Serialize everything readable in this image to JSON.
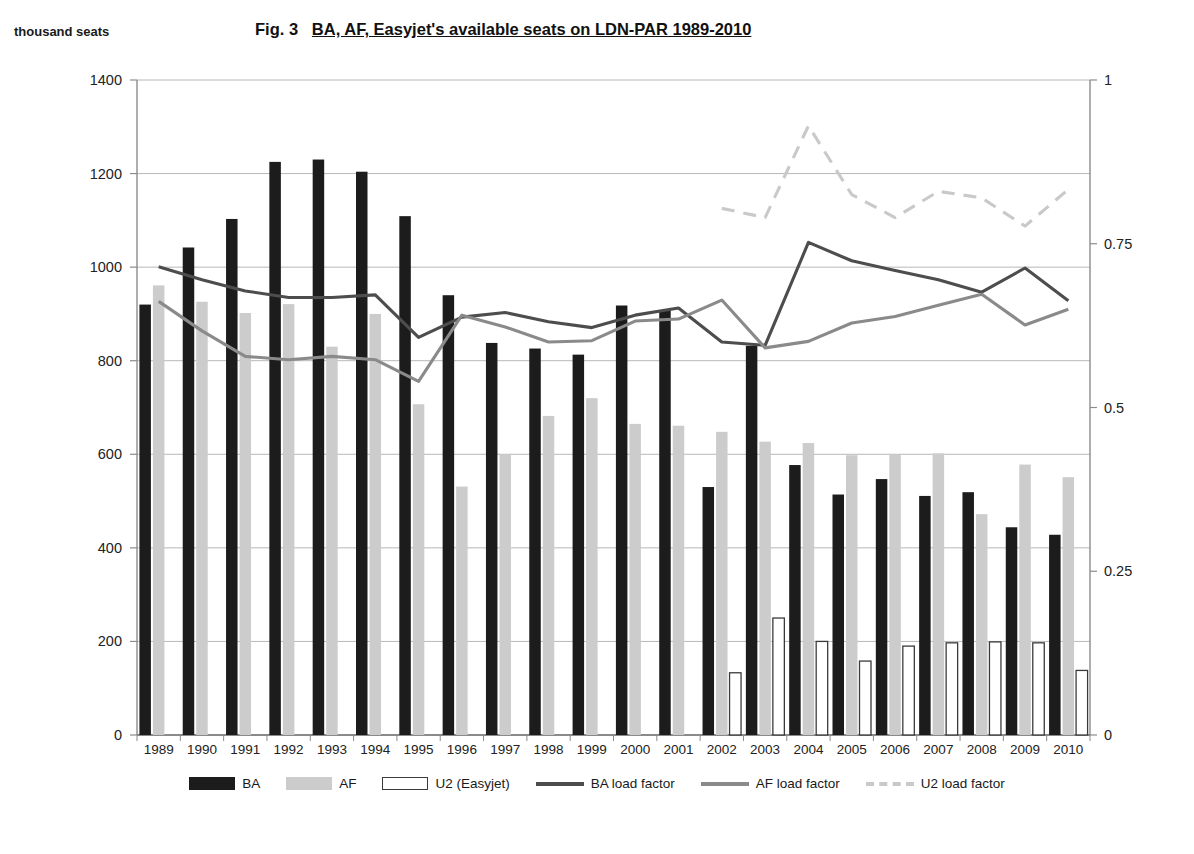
{
  "axis_unit_label": "thousand seats",
  "title": {
    "prefix": "Fig. 3",
    "main": "BA, AF, Easyjet's available seats on LDN-PAR 1989-2010",
    "full": "Fig. 3  BA, AF, Easyjet's available seats on LDN-PAR 1989-2010"
  },
  "colors": {
    "ba_bar": "#1c1c1c",
    "af_bar": "#cccccc",
    "u2_bar": "#ffffff",
    "u2_bar_border": "#3a3a3a",
    "ba_line": "#4d4d4d",
    "af_line": "#8a8a8a",
    "u2_line": "#c9c9c9",
    "grid": "#b8b8b8",
    "axis": "#8c8c8c",
    "text": "#1a1a1a"
  },
  "legend": [
    {
      "label": "BA",
      "type": "bar",
      "color": "#1c1c1c"
    },
    {
      "label": "AF",
      "type": "bar",
      "color": "#cccccc"
    },
    {
      "label": "U2 (Easyjet)",
      "type": "bar-outline",
      "color": "#ffffff"
    },
    {
      "label": "BA load factor",
      "type": "line",
      "color": "#4d4d4d"
    },
    {
      "label": "AF load factor",
      "type": "line",
      "color": "#8a8a8a"
    },
    {
      "label": "U2 load factor",
      "type": "dashed-line",
      "color": "#c9c9c9"
    }
  ],
  "chart_data": {
    "type": "bar",
    "xlabel": "",
    "ylabel": "thousand seats",
    "y2label": "",
    "ylim": [
      0,
      1400
    ],
    "y2lim": [
      0,
      1
    ],
    "yticks": [
      0,
      200,
      400,
      600,
      800,
      1000,
      1200,
      1400
    ],
    "y2ticks": [
      0,
      0.25,
      0.5,
      0.75,
      1
    ],
    "grid": true,
    "legend_position": "bottom",
    "categories": [
      "1989",
      "1990",
      "1991",
      "1992",
      "1993",
      "1994",
      "1995",
      "1996",
      "1997",
      "1998",
      "1999",
      "2000",
      "2001",
      "2002",
      "2003",
      "2004",
      "2005",
      "2006",
      "2007",
      "2008",
      "2009",
      "2010"
    ],
    "series": [
      {
        "name": "BA",
        "axis": "left",
        "kind": "bar",
        "values": [
          920,
          1042,
          1103,
          1225,
          1230,
          1204,
          1109,
          940,
          838,
          826,
          813,
          918,
          908,
          530,
          832,
          577,
          514,
          547,
          511,
          519,
          444,
          428
        ]
      },
      {
        "name": "AF",
        "axis": "left",
        "kind": "bar",
        "values": [
          961,
          926,
          902,
          921,
          830,
          900,
          707,
          531,
          599,
          682,
          720,
          665,
          661,
          648,
          627,
          624,
          598,
          599,
          602,
          472,
          578,
          551
        ]
      },
      {
        "name": "U2 (Easyjet)",
        "axis": "left",
        "kind": "bar",
        "values": [
          null,
          null,
          null,
          null,
          null,
          null,
          null,
          null,
          null,
          null,
          null,
          null,
          null,
          133,
          250,
          200,
          158,
          190,
          197,
          199,
          197,
          138
        ]
      },
      {
        "name": "BA load factor",
        "axis": "right",
        "kind": "line",
        "values": [
          0.715,
          0.695,
          0.678,
          0.668,
          0.668,
          0.672,
          0.607,
          0.638,
          0.645,
          0.631,
          0.622,
          0.641,
          0.652,
          0.6,
          0.595,
          0.752,
          0.724,
          0.709,
          0.695,
          0.676,
          0.713,
          0.663
        ]
      },
      {
        "name": "AF load factor",
        "axis": "right",
        "kind": "line",
        "values": [
          0.662,
          0.617,
          0.578,
          0.573,
          0.578,
          0.573,
          0.54,
          0.641,
          0.623,
          0.6,
          0.602,
          0.632,
          0.635,
          0.664,
          0.591,
          0.601,
          0.629,
          0.639,
          0.656,
          0.673,
          0.626,
          0.65
        ]
      },
      {
        "name": "U2 load factor",
        "axis": "right",
        "kind": "dashed-line",
        "values": [
          null,
          null,
          null,
          null,
          null,
          null,
          null,
          null,
          null,
          null,
          null,
          null,
          null,
          0.804,
          0.79,
          0.93,
          0.825,
          0.79,
          0.83,
          0.82,
          0.777,
          0.833
        ]
      }
    ]
  }
}
